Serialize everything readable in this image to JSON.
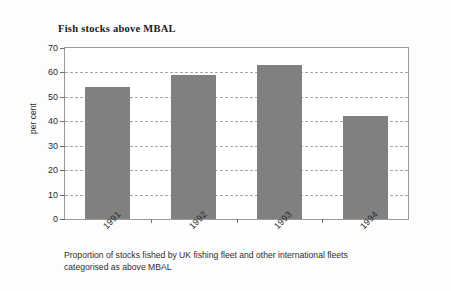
{
  "chart_data": {
    "type": "bar",
    "title": "Fish stocks above MBAL",
    "xlabel": "",
    "ylabel": "per cent",
    "categories": [
      "1991",
      "1992",
      "1993",
      "1994"
    ],
    "values": [
      54,
      59,
      63,
      42
    ],
    "ylim": [
      0,
      70
    ],
    "ytick_values": [
      0,
      10,
      20,
      30,
      40,
      50,
      60,
      70
    ],
    "ytick_labels": [
      "0",
      "10",
      "20",
      "30",
      "40",
      "50",
      "60",
      "70"
    ],
    "grid": true,
    "grid_orientation": "horizontal",
    "grid_style": "dashed",
    "legend": false,
    "series": [
      {
        "name": "Proportion above MBAL",
        "values": [
          54,
          59,
          63,
          42
        ]
      }
    ],
    "bar_color": "#808080",
    "axis_color": "#6f6f6f",
    "gridline_color": "#a8a8a8",
    "background_color": "#ffffff",
    "caption_line_1": "Proportion of stocks fished by UK fishing fleet and other international fleets",
    "caption_line_2": "categorised as above MBAL"
  }
}
